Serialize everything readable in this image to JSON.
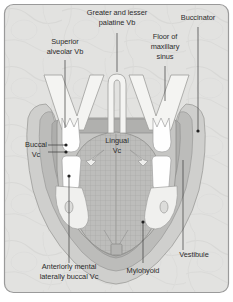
{
  "figure": {
    "frame": {
      "border_color": "#9a9a9a",
      "background_color": "#e2e2e0",
      "corner_radius": 9
    },
    "palette": {
      "background": "#e2e2e0",
      "border": "#9a9a9a",
      "nerve_light": "#f2f2f0",
      "tooth_white": "#fefefe",
      "soft_tissue_mid": "#c9c9c7",
      "soft_tissue_dark": "#b3b3b1",
      "mucosa_band": "#a9a9a7",
      "tongue_fill": "#bdbdbb",
      "tongue_hatch": "#a2a2a0",
      "outline": "#8e8e8c",
      "text": "#2b2b2b",
      "leader": "#3a3a3a"
    }
  },
  "labels": [
    {
      "id": "superior-alveolar-vb",
      "name": "superior-alveolar-vb-label",
      "lines": [
        "Superior",
        "alveolar Vb"
      ],
      "x": 65,
      "y": 47,
      "align": "middle"
    },
    {
      "id": "greater-lesser-palatine-vb",
      "name": "greater-and-lesser-palatine-vb-label",
      "lines": [
        "Greater and lesser",
        "palatine Vb"
      ],
      "x": 117,
      "y": 18,
      "align": "middle"
    },
    {
      "id": "buccinator",
      "name": "buccinator-label",
      "lines": [
        "Buccinator"
      ],
      "x": 198,
      "y": 18,
      "align": "middle"
    },
    {
      "id": "floor-maxillary-sinus",
      "name": "floor-of-maxillary-sinus-label",
      "lines": [
        "Floor of",
        "maxillary",
        "sinus"
      ],
      "x": 165,
      "y": 47,
      "align": "middle"
    },
    {
      "id": "buccal-vc",
      "name": "buccal-vc-label",
      "lines": [
        "Buccal",
        "Vc"
      ],
      "x": 36,
      "y": 150,
      "align": "middle"
    },
    {
      "id": "lingual-vc",
      "name": "lingual-vc-label",
      "lines": [
        "Lingual",
        "Vc"
      ],
      "x": 117,
      "y": 146,
      "align": "middle"
    },
    {
      "id": "vestibule",
      "name": "vestibule-label",
      "lines": [
        "Vestibule"
      ],
      "x": 194,
      "y": 255,
      "align": "middle"
    },
    {
      "id": "mylohyoid",
      "name": "mylohyoid-label",
      "lines": [
        "Mylohyoid"
      ],
      "x": 143,
      "y": 271,
      "align": "middle"
    },
    {
      "id": "anteriorly-mental-laterally-buccal-vc",
      "name": "anteriorly-mental-laterally-buccal-vc-label",
      "lines": [
        "Anteriorly mental",
        "laterally buccal Vc"
      ],
      "x": 69,
      "y": 272,
      "align": "middle"
    }
  ],
  "leaders": [
    {
      "id": "leader-superior-alveolar",
      "name": "leader-superior-alveolar-vb",
      "path": "M 65 60 L 65 128",
      "dot": null
    },
    {
      "id": "leader-palatine",
      "name": "leader-greater-lesser-palatine-vb",
      "path": "M 117 33 L 117 72",
      "dot": null
    },
    {
      "id": "leader-buccinator",
      "name": "leader-buccinator",
      "path": "M 198 27 L 198 131",
      "dot": [
        198,
        131
      ]
    },
    {
      "id": "leader-sinus",
      "name": "leader-floor-of-maxillary-sinus",
      "path": "M 165 66 L 165 101",
      "dot": null
    },
    {
      "id": "leader-buccal-upper",
      "name": "leader-buccal-vc-upper",
      "path": "M 48 145 L 66 145",
      "dot": [
        66,
        145
      ]
    },
    {
      "id": "leader-buccal-lower",
      "name": "leader-buccal-vc-lower",
      "path": "M 48 152 L 66 152",
      "dot": [
        66,
        152
      ]
    },
    {
      "id": "leader-mental",
      "name": "leader-anteriorly-mental-laterally-buccal-vc",
      "path": "M 69 263 L 69 176",
      "dot": [
        69,
        176
      ]
    },
    {
      "id": "leader-mylohyoid",
      "name": "leader-mylohyoid",
      "path": "M 143 263 L 143 222",
      "dot": [
        143,
        222
      ]
    },
    {
      "id": "leader-vestibule",
      "name": "leader-vestibule",
      "path": "M 183 250 L 183 160",
      "dot": null
    }
  ],
  "anatomy": {
    "parts": [
      {
        "name": "maxillary-nerve-branch-left",
        "description": "V-shaped superior alveolar nerve, left"
      },
      {
        "name": "maxillary-nerve-branch-right",
        "description": "V-shaped superior alveolar nerve, right"
      },
      {
        "name": "palatine-nerve-central",
        "description": "Inverted-U greater and lesser palatine nerve"
      },
      {
        "name": "tongue",
        "description": "Cross-hatched tongue body"
      },
      {
        "name": "mandible-body",
        "description": "Mandible outline"
      },
      {
        "name": "tooth-upper-left",
        "description": "Upper left molar crown"
      },
      {
        "name": "tooth-upper-right",
        "description": "Upper right molar crown"
      },
      {
        "name": "tooth-lower-left",
        "description": "Lower left molar crown"
      },
      {
        "name": "tooth-lower-right",
        "description": "Lower right molar crown"
      },
      {
        "name": "mental-foramen-left",
        "description": "Left mental foramen oval"
      },
      {
        "name": "mental-foramen-right",
        "description": "Right mental foramen oval"
      },
      {
        "name": "symphysis-marker",
        "description": "Small square at mandibular symphysis"
      }
    ]
  }
}
